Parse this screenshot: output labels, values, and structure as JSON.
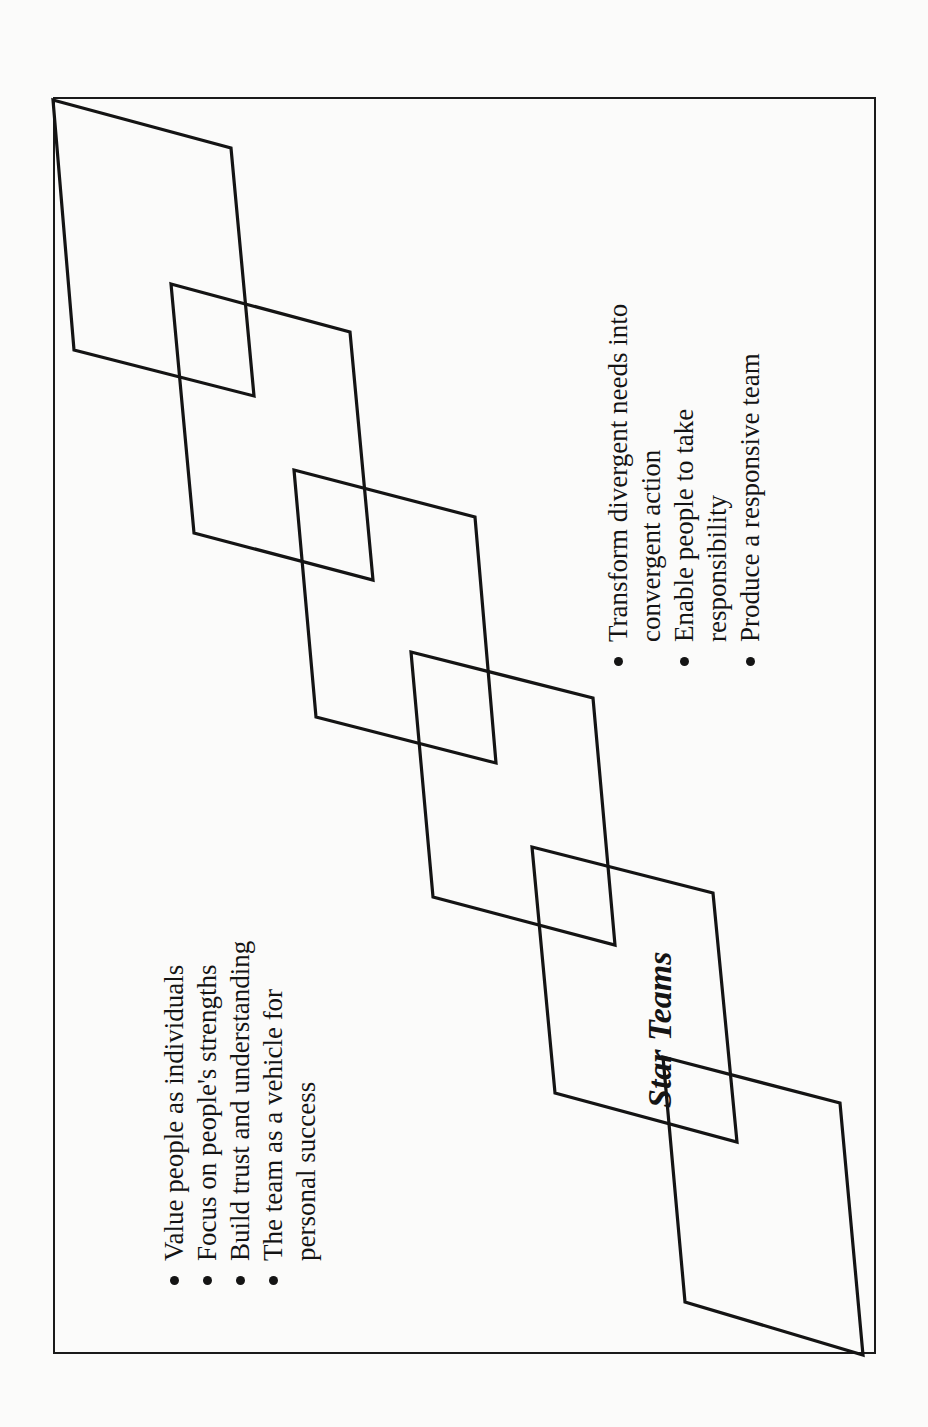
{
  "diagram": {
    "title": "Star Teams",
    "orientation": "rotated-90-ccw",
    "line_color": "#141414",
    "background_color": "#fbfbfa",
    "parallelograms": [
      {
        "id": 1,
        "points": "53,100 231,148 254,396 74,350"
      },
      {
        "id": 2,
        "points": "171,284 350,332 373,580 194,533"
      },
      {
        "id": 3,
        "points": "294,470 475,517 496,763 316,717"
      },
      {
        "id": 4,
        "points": "411,652 593,698 615,945 433,897"
      },
      {
        "id": 5,
        "points": "532,847 713,893 737,1142 555,1093"
      },
      {
        "id": 6,
        "points": "663,1057 840,1103 863,1355 685,1302"
      }
    ],
    "left_list": {
      "items": [
        {
          "lines": [
            "Value people as individuals"
          ]
        },
        {
          "lines": [
            "Focus on people's strengths"
          ]
        },
        {
          "lines": [
            "Build trust and understanding"
          ]
        },
        {
          "lines": [
            "The team as a vehicle for",
            "personal success"
          ]
        }
      ]
    },
    "right_list": {
      "items": [
        {
          "lines": [
            "Transform divergent needs into",
            "convergent action"
          ]
        },
        {
          "lines": [
            "Enable people to take",
            "responsibility"
          ]
        },
        {
          "lines": [
            "Produce a responsive team"
          ]
        }
      ]
    }
  }
}
